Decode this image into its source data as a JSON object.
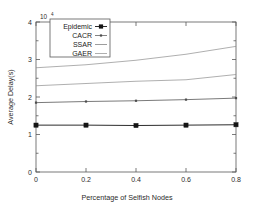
{
  "chart_data": {
    "type": "line",
    "title": "",
    "xlabel": "Percentage of Selfish Nodes",
    "ylabel": "Average Delay(s)",
    "y_multiplier": "10",
    "y_multiplier_exp": "4",
    "xlim": [
      0,
      0.8
    ],
    "ylim": [
      0,
      4
    ],
    "grid": false,
    "legend_position": "top-left-inside",
    "x": [
      0,
      0.2,
      0.4,
      0.6,
      0.8
    ],
    "xticks": [
      "0",
      "0.2",
      "0.4",
      "0.6",
      "0.8"
    ],
    "yticks": [
      "0",
      "1",
      "2",
      "3",
      "4"
    ],
    "yminor": [
      0.5,
      1.5,
      2.5,
      3.5
    ],
    "series": [
      {
        "name": "Epidemic",
        "marker": "filled-square",
        "color": "#141414",
        "values": [
          1.25,
          1.25,
          1.24,
          1.25,
          1.26
        ]
      },
      {
        "name": "CACR",
        "marker": "small-dot",
        "color": "#4d4d4d",
        "values": [
          1.85,
          1.88,
          1.9,
          1.93,
          1.97
        ]
      },
      {
        "name": "SSAR",
        "marker": "none",
        "color": "#737373",
        "values": [
          2.3,
          2.36,
          2.42,
          2.46,
          2.6
        ]
      },
      {
        "name": "GAER",
        "marker": "none",
        "color": "#8c8c8c",
        "values": [
          2.78,
          2.86,
          2.98,
          3.14,
          3.35
        ]
      }
    ]
  }
}
